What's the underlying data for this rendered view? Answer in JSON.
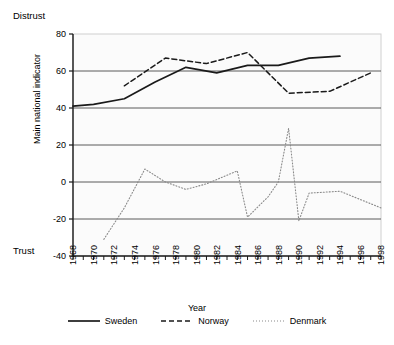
{
  "annotations": {
    "top_pole": "Distrust",
    "bottom_pole": "Trust"
  },
  "chart_data": {
    "type": "line",
    "title": "",
    "xlabel": "Year",
    "ylabel": "Main national indicator",
    "xlim": [
      1968,
      1998
    ],
    "ylim": [
      -40,
      80
    ],
    "yticks": [
      80,
      60,
      40,
      20,
      0,
      -20,
      -40
    ],
    "ytick_labels": [
      "80",
      "60",
      "40",
      "20",
      "0",
      "-20",
      "-40"
    ],
    "xticks": [
      1968,
      1970,
      1972,
      1974,
      1976,
      1978,
      1980,
      1982,
      1984,
      1986,
      1988,
      1990,
      1992,
      1994,
      1996,
      1998
    ],
    "xtick_labels": [
      "1968",
      "1970",
      "1972",
      "1974",
      "1976",
      "1978",
      "1980",
      "1982",
      "1984",
      "1986",
      "1988",
      "1990",
      "1992",
      "1994",
      "1996",
      "1998"
    ],
    "grid": "horizontal",
    "legend_position": "bottom",
    "series": [
      {
        "name": "Sweden",
        "style": "solid",
        "color": "#1a1a1a",
        "x": [
          1968,
          1970,
          1973,
          1976,
          1979,
          1982,
          1985,
          1988,
          1991,
          1994
        ],
        "values": [
          41,
          42,
          45,
          54,
          62,
          59,
          63,
          63,
          67,
          68
        ]
      },
      {
        "name": "Norway",
        "style": "dashed",
        "color": "#1a1a1a",
        "x": [
          1973,
          1977,
          1981,
          1985,
          1989,
          1993,
          1997
        ],
        "values": [
          52,
          67,
          64,
          70,
          48,
          49,
          59
        ]
      },
      {
        "name": "Denmark",
        "style": "dotted",
        "color": "#8a8a8a",
        "x": [
          1971,
          1973,
          1975,
          1977,
          1979,
          1981,
          1984,
          1985,
          1987,
          1988,
          1989,
          1990,
          1991,
          1994,
          1998
        ],
        "values": [
          -31,
          -14,
          7,
          0,
          -4,
          -1,
          6,
          -19,
          -8,
          0,
          29,
          -21,
          -6,
          -5,
          -14
        ]
      }
    ]
  },
  "legend": {
    "items": [
      {
        "label": "Sweden",
        "style": "solid"
      },
      {
        "label": "Norway",
        "style": "dashed"
      },
      {
        "label": "Denmark",
        "style": "dotted"
      }
    ]
  }
}
